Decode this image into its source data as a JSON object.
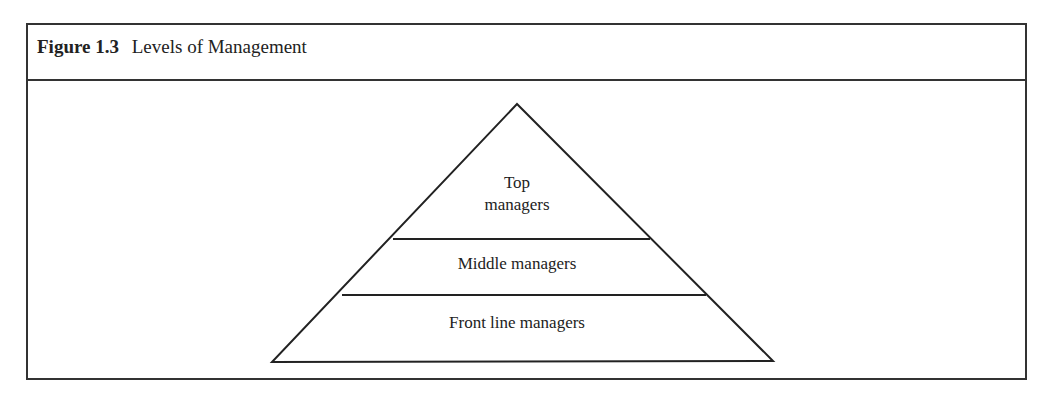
{
  "figure": {
    "number": "Figure 1.3",
    "title": "Levels of Management"
  },
  "pyramid": {
    "levels": [
      {
        "line1": "Top",
        "line2": "managers"
      },
      {
        "label": "Middle managers"
      },
      {
        "label": "Front line managers"
      }
    ],
    "stroke_color": "#222222"
  }
}
